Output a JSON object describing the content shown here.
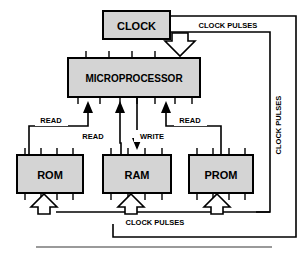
{
  "diagram": {
    "colors": {
      "block_fill": "#d4d4d4",
      "block_stroke": "#000000",
      "line": "#000000",
      "background": "#ffffff",
      "rule": "#808080"
    },
    "blocks": [
      {
        "id": "clock",
        "label": "CLOCK",
        "x": 103,
        "y": 11,
        "w": 67,
        "h": 28,
        "font_size": 11
      },
      {
        "id": "microprocessor",
        "label": "MICROPROCESSOR",
        "x": 68,
        "y": 58,
        "w": 132,
        "h": 39,
        "font_size": 10
      },
      {
        "id": "rom",
        "label": "ROM",
        "x": 17,
        "y": 155,
        "w": 66,
        "h": 38,
        "font_size": 11
      },
      {
        "id": "ram",
        "label": "RAM",
        "x": 103,
        "y": 155,
        "w": 68,
        "h": 38,
        "font_size": 11
      },
      {
        "id": "prom",
        "label": "PROM",
        "x": 189,
        "y": 155,
        "w": 64,
        "h": 38,
        "font_size": 11
      }
    ],
    "signal_labels": [
      {
        "id": "clock-pulses-top",
        "text": "CLOCK PULSES",
        "x": 228,
        "y": 25,
        "font_size": 7.5,
        "rotate": 0
      },
      {
        "id": "clock-pulses-right",
        "text": "CLOCK PULSES",
        "x": 278,
        "y": 125,
        "font_size": 7.5,
        "rotate": -90
      },
      {
        "id": "clock-pulses-bottom",
        "text": "CLOCK PULSES",
        "x": 155,
        "y": 222,
        "font_size": 7.5,
        "rotate": 0
      },
      {
        "id": "read-rom",
        "text": "READ",
        "x": 51,
        "y": 120,
        "font_size": 7.5,
        "rotate": 0
      },
      {
        "id": "read-ram",
        "text": "READ",
        "x": 93,
        "y": 136,
        "font_size": 7.5,
        "rotate": 0
      },
      {
        "id": "write-ram",
        "text": "WRITE",
        "x": 152,
        "y": 136,
        "font_size": 7.5,
        "rotate": 0
      },
      {
        "id": "read-prom",
        "text": "READ",
        "x": 190,
        "y": 120,
        "font_size": 7.5,
        "rotate": 0
      }
    ],
    "connections": [
      {
        "id": "clock-to-microprocessor",
        "from": "clock",
        "to": "microprocessor",
        "signal": "CLOCK PULSES",
        "style": "hollow-arrow"
      },
      {
        "id": "clock-bus-right",
        "from": "clock",
        "to": "memory-bus",
        "signal": "CLOCK PULSES",
        "style": "line"
      },
      {
        "id": "rom-to-microprocessor",
        "from": "rom",
        "to": "microprocessor",
        "signal": "READ",
        "style": "solid-arrow"
      },
      {
        "id": "ram-to-microprocessor",
        "from": "ram",
        "to": "microprocessor",
        "signal": "READ",
        "style": "solid-arrow"
      },
      {
        "id": "microprocessor-to-ram",
        "from": "microprocessor",
        "to": "ram",
        "signal": "WRITE",
        "style": "solid-arrow"
      },
      {
        "id": "prom-to-microprocessor",
        "from": "prom",
        "to": "microprocessor",
        "signal": "READ",
        "style": "solid-arrow"
      },
      {
        "id": "clock-to-rom",
        "from": "clock",
        "to": "rom",
        "signal": "CLOCK PULSES",
        "style": "hollow-arrow"
      },
      {
        "id": "clock-to-ram",
        "from": "clock",
        "to": "ram",
        "signal": "CLOCK PULSES",
        "style": "hollow-arrow"
      },
      {
        "id": "clock-to-prom",
        "from": "clock",
        "to": "prom",
        "signal": "CLOCK PULSES",
        "style": "hollow-arrow"
      }
    ]
  }
}
